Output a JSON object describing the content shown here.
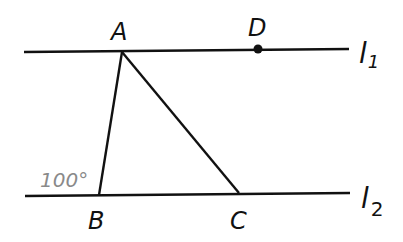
{
  "diagram": {
    "type": "geometry",
    "colors": {
      "line": "#111111",
      "angle_label": "#8a8a8a",
      "background": "#ffffff"
    },
    "lines": [
      {
        "name": "l1",
        "label": "l",
        "subscript": "1",
        "from": [
          24,
          52
        ],
        "to": [
          349,
          49
        ]
      },
      {
        "name": "l2",
        "label": "l",
        "subscript": "2",
        "from": [
          25,
          196
        ],
        "to": [
          350,
          193
        ]
      }
    ],
    "points": [
      {
        "name": "A",
        "label": "A",
        "at": [
          122,
          52
        ]
      },
      {
        "name": "D",
        "label": "D",
        "at": [
          258,
          49
        ],
        "marked": true
      },
      {
        "name": "B",
        "label": "B",
        "at": [
          99,
          195
        ]
      },
      {
        "name": "C",
        "label": "C",
        "at": [
          239,
          193
        ]
      }
    ],
    "segments": [
      [
        "A",
        "B"
      ],
      [
        "A",
        "C"
      ]
    ],
    "angle": {
      "vertex": "B",
      "label": "100°",
      "position": "exterior-left"
    }
  }
}
